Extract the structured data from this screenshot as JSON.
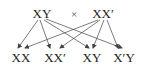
{
  "diagram": {
    "type": "genetic-cross",
    "parents": [
      {
        "id": "p1",
        "label": "XY",
        "x": 42,
        "y": 7
      },
      {
        "id": "p2",
        "label": "XX′",
        "x": 103,
        "y": 7
      }
    ],
    "operator": {
      "label": "×",
      "x": 74,
      "y": 8
    },
    "offspring": [
      {
        "id": "o1",
        "label": "XX",
        "x": 21,
        "y": 51
      },
      {
        "id": "o2",
        "label": "XX′",
        "x": 55,
        "y": 51
      },
      {
        "id": "o3",
        "label": "XY",
        "x": 92,
        "y": 51
      },
      {
        "id": "o4",
        "label": "X′Y",
        "x": 124,
        "y": 51
      }
    ],
    "arrows": [
      {
        "from": "p1",
        "to": "o1",
        "x1": 38,
        "y1": 20,
        "x2": 18,
        "y2": 48
      },
      {
        "from": "p1",
        "to": "o2",
        "x1": 40,
        "y1": 20,
        "x2": 50,
        "y2": 48
      },
      {
        "from": "p1",
        "to": "o3",
        "x1": 44,
        "y1": 20,
        "x2": 89,
        "y2": 48
      },
      {
        "from": "p1",
        "to": "o4",
        "x1": 46,
        "y1": 19,
        "x2": 122,
        "y2": 48
      },
      {
        "from": "p2",
        "to": "o1",
        "x1": 98,
        "y1": 20,
        "x2": 25,
        "y2": 48
      },
      {
        "from": "p2",
        "to": "o2",
        "x1": 100,
        "y1": 20,
        "x2": 60,
        "y2": 48
      },
      {
        "from": "p2",
        "to": "o3",
        "x1": 104,
        "y1": 20,
        "x2": 93,
        "y2": 48
      },
      {
        "from": "p2",
        "to": "o4",
        "x1": 107,
        "y1": 20,
        "x2": 118,
        "y2": 48
      }
    ],
    "colors": {
      "line": "#444444",
      "text": "#222222",
      "background": "#ffffff"
    }
  }
}
